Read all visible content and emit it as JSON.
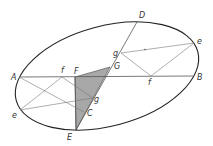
{
  "figure": {
    "colors": {
      "stroke": "#222222",
      "construction": "#777777",
      "shade": "#a8a8a8"
    },
    "ellipse": {
      "cx": 107,
      "cy": 76,
      "rx": 94,
      "ry": 50,
      "rotate": -15
    },
    "points": {
      "A": {
        "label": "A",
        "x": 19,
        "y": 77
      },
      "B": {
        "label": "B",
        "x": 194,
        "y": 76
      },
      "D": {
        "label": "D",
        "x": 137,
        "y": 22
      },
      "E": {
        "label": "E",
        "x": 76,
        "y": 130
      },
      "F": {
        "label": "F",
        "x": 75,
        "y": 77
      },
      "G": {
        "label": "G",
        "x": 110,
        "y": 67
      },
      "C": {
        "label": "C",
        "x": 84,
        "y": 112
      },
      "g_lower": {
        "label": "g",
        "x": 93,
        "y": 98
      },
      "g_upper": {
        "label": "g",
        "x": 121,
        "y": 53
      },
      "f_left": {
        "label": "f",
        "x": 62,
        "y": 77
      },
      "f_right": {
        "label": "f",
        "x": 151,
        "y": 76
      },
      "e_left": {
        "label": "e",
        "x": 20,
        "y": 110
      },
      "e_right": {
        "label": "e",
        "x": 194,
        "y": 43
      }
    }
  }
}
